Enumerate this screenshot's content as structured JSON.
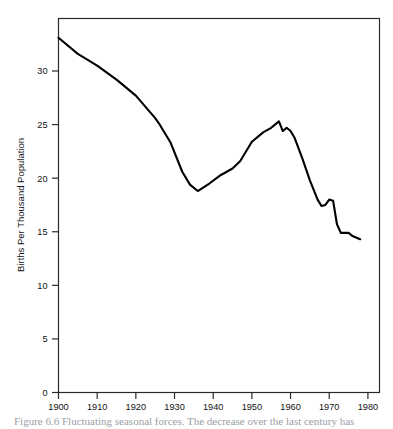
{
  "figure": {
    "caption": "Figure 6.6  Fluctuating seasonal forces. The decrease over the last century has"
  },
  "chart_data": {
    "type": "line",
    "title": "",
    "xlabel": "",
    "ylabel": "Births Per Thousand Population",
    "xlim": [
      1900,
      1983
    ],
    "ylim": [
      0,
      34.9
    ],
    "grid": false,
    "legend": "none",
    "xticks": [
      1900,
      1910,
      1920,
      1930,
      1940,
      1950,
      1960,
      1970,
      1980
    ],
    "xtick_labels": [
      "1900",
      "1910",
      "1920",
      "1930",
      "1940",
      "1950",
      "1960",
      "1970",
      "1980"
    ],
    "yticks": [
      0,
      5,
      10,
      15,
      20,
      25,
      30
    ],
    "ytick_labels": [
      "0",
      "5",
      "10",
      "15",
      "20",
      "25",
      "30"
    ],
    "line_color": "#000000",
    "line_width": 2.1,
    "series": [
      {
        "name": "Births Per Thousand Population",
        "x": [
          1900,
          1905,
          1910,
          1915,
          1920,
          1925,
          1926,
          1929,
          1932,
          1934,
          1936,
          1939,
          1942,
          1945,
          1947,
          1950,
          1953,
          1955,
          1957,
          1958,
          1959,
          1960,
          1961,
          1963,
          1965,
          1967,
          1968,
          1969,
          1970,
          1971,
          1972,
          1973,
          1975,
          1976,
          1978
        ],
        "y": [
          33.1,
          31.6,
          30.5,
          29.2,
          27.7,
          25.6,
          25.1,
          23.3,
          20.6,
          19.4,
          18.8,
          19.5,
          20.3,
          20.9,
          21.6,
          23.4,
          24.3,
          24.7,
          25.3,
          24.4,
          24.7,
          24.4,
          23.8,
          21.9,
          19.8,
          18.0,
          17.4,
          17.5,
          18.0,
          17.9,
          15.7,
          14.9,
          14.9,
          14.6,
          14.3
        ]
      }
    ]
  },
  "axes": {
    "y_axis_title": "Births Per Thousand Population"
  }
}
